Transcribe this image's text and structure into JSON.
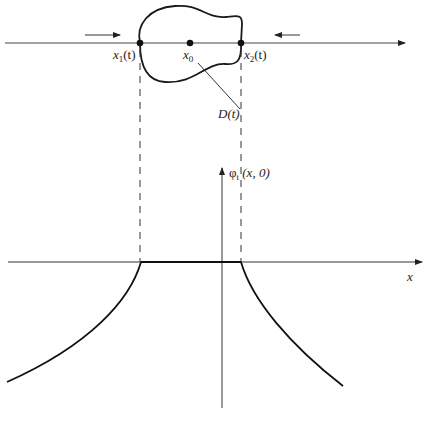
{
  "diagram": {
    "type": "schematic",
    "top_panel": {
      "labels": {
        "x1": "x",
        "x1_sub": "1",
        "x1_arg": "(t)",
        "x0": "x",
        "x0_sub": "0",
        "x2": "x",
        "x2_sub": "2",
        "x2_arg": "(t)",
        "domain": "D(t)"
      },
      "points": [
        {
          "name": "x1(t)",
          "px": [
            140,
            43
          ]
        },
        {
          "name": "x0",
          "px": [
            190,
            43
          ]
        },
        {
          "name": "x2(t)",
          "px": [
            241,
            43
          ]
        }
      ],
      "arrows": [
        {
          "direction": "right",
          "from": [
            85,
            35
          ],
          "to": [
            120,
            35
          ]
        },
        {
          "direction": "left",
          "from": [
            300,
            35
          ],
          "to": [
            275,
            35
          ]
        }
      ]
    },
    "bottom_panel": {
      "y_axis_label_phi": "φ",
      "y_axis_label_sub": "t",
      "y_axis_label_arg": " (x, 0)",
      "x_axis_label": "x",
      "flat_segment": {
        "from_x": 141,
        "to_x": 241,
        "y": 262
      },
      "curves": [
        {
          "side": "left",
          "from": [
            141,
            262
          ],
          "to": [
            7,
            382
          ]
        },
        {
          "side": "right",
          "from": [
            241,
            262
          ],
          "to": [
            343,
            386
          ]
        }
      ]
    },
    "colors": {
      "stroke": "#1a1a1a",
      "axis": "#333333",
      "background": "#ffffff"
    }
  }
}
